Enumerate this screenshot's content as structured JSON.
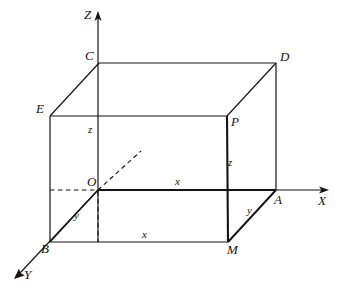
{
  "figure": {
    "kind": "3d-rectangular-box-coordinate-diagram",
    "background_color": "#ffffff",
    "stroke_color": "#141414",
    "axes": [
      {
        "name": "z-axis",
        "label": "Z",
        "label_x": 84,
        "label_y": 14,
        "direction": "up"
      },
      {
        "name": "x-axis",
        "label": "X",
        "label_x": 318,
        "label_y": 197,
        "direction": "right"
      },
      {
        "name": "y-axis",
        "label": "Y",
        "label_x": 24,
        "label_y": 272,
        "direction": "down-left"
      }
    ],
    "vertices": [
      {
        "name": "origin",
        "label": "O",
        "label_x": 87,
        "label_y": 178
      },
      {
        "name": "vertex-a",
        "label": "A",
        "label_x": 274,
        "label_y": 196
      },
      {
        "name": "vertex-b",
        "label": "B",
        "label_x": 41,
        "label_y": 245
      },
      {
        "name": "vertex-c",
        "label": "C",
        "label_x": 85,
        "label_y": 52
      },
      {
        "name": "vertex-d",
        "label": "D",
        "label_x": 280,
        "label_y": 53
      },
      {
        "name": "vertex-e",
        "label": "E",
        "label_x": 36,
        "label_y": 105
      },
      {
        "name": "vertex-p",
        "label": "P",
        "label_x": 231,
        "label_y": 118
      },
      {
        "name": "vertex-m",
        "label": "M",
        "label_x": 227,
        "label_y": 246
      }
    ],
    "edge_labels": [
      {
        "name": "edge-label-x-top",
        "label": "x",
        "label_x": 175,
        "label_y": 179
      },
      {
        "name": "edge-label-x-bottom",
        "label": "x",
        "label_x": 142,
        "label_y": 232
      },
      {
        "name": "edge-label-y-left",
        "label": "y",
        "label_x": 74,
        "label_y": 213
      },
      {
        "name": "edge-label-y-right",
        "label": "y",
        "label_x": 247,
        "label_y": 208
      },
      {
        "name": "edge-label-z-left",
        "label": "z",
        "label_x": 88,
        "label_y": 127
      },
      {
        "name": "edge-label-z-right",
        "label": "z",
        "label_x": 228,
        "label_y": 160
      }
    ]
  }
}
